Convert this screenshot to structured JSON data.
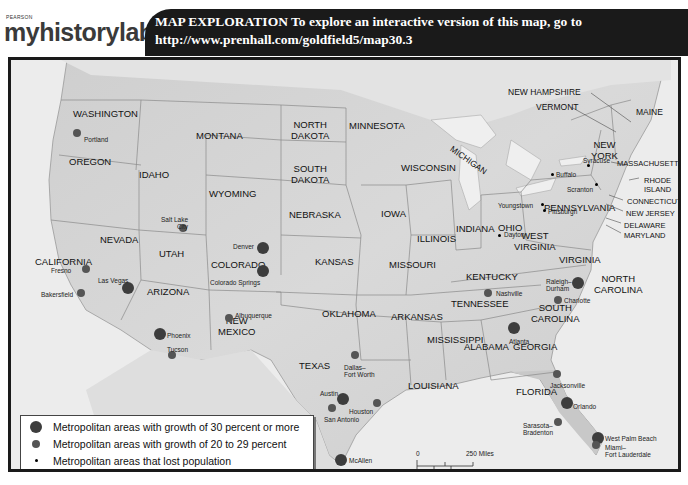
{
  "header": {
    "logo_small": "PEARSON",
    "logo_brand": "myhistorylab",
    "banner_line1": "MAP EXPLORATION  To explore an interactive version of this map, go to",
    "banner_line2": "http://www.prenhall.com/goldfield5/map30.3"
  },
  "map": {
    "states": [
      {
        "name": "WASHINGTON",
        "x": 62,
        "y": 48
      },
      {
        "name": "OREGON",
        "x": 58,
        "y": 96
      },
      {
        "name": "IDAHO",
        "x": 128,
        "y": 109
      },
      {
        "name": "MONTANA",
        "x": 185,
        "y": 70
      },
      {
        "name": "WYOMING",
        "x": 198,
        "y": 128
      },
      {
        "name": "NEVADA",
        "x": 89,
        "y": 174
      },
      {
        "name": "UTAH",
        "x": 148,
        "y": 188
      },
      {
        "name": "COLORADO",
        "x": 200,
        "y": 199
      },
      {
        "name": "CALIFORNIA",
        "x": 24,
        "y": 196
      },
      {
        "name": "ARIZONA",
        "x": 136,
        "y": 226
      },
      {
        "name": "NEW\nMEXICO",
        "x": 207,
        "y": 255
      },
      {
        "name": "NORTH\nDAKOTA",
        "x": 280,
        "y": 59
      },
      {
        "name": "SOUTH\nDAKOTA",
        "x": 280,
        "y": 103
      },
      {
        "name": "NEBRASKA",
        "x": 278,
        "y": 149
      },
      {
        "name": "KANSAS",
        "x": 304,
        "y": 196
      },
      {
        "name": "OKLAHOMA",
        "x": 311,
        "y": 248
      },
      {
        "name": "TEXAS",
        "x": 288,
        "y": 300
      },
      {
        "name": "MINNESOTA",
        "x": 338,
        "y": 60
      },
      {
        "name": "IOWA",
        "x": 370,
        "y": 148
      },
      {
        "name": "MISSOURI",
        "x": 378,
        "y": 199
      },
      {
        "name": "ARKANSAS",
        "x": 380,
        "y": 251
      },
      {
        "name": "LOUISIANA",
        "x": 397,
        "y": 320
      },
      {
        "name": "MISSISSIPPI",
        "x": 416,
        "y": 274
      },
      {
        "name": "WISCONSIN",
        "x": 390,
        "y": 102
      },
      {
        "name": "ILLINOIS",
        "x": 406,
        "y": 173
      },
      {
        "name": "MICHIGAN",
        "x": 436,
        "y": 95
      },
      {
        "name": "INDIANA",
        "x": 445,
        "y": 163
      },
      {
        "name": "OHIO",
        "x": 487,
        "y": 162
      },
      {
        "name": "KENTUCKY",
        "x": 455,
        "y": 211
      },
      {
        "name": "TENNESSEE",
        "x": 440,
        "y": 238
      },
      {
        "name": "ALABAMA",
        "x": 453,
        "y": 281
      },
      {
        "name": "GEORGIA",
        "x": 502,
        "y": 281
      },
      {
        "name": "FLORIDA",
        "x": 505,
        "y": 326
      },
      {
        "name": "SOUTH\nCAROLINA",
        "x": 520,
        "y": 242
      },
      {
        "name": "NORTH\nCAROLINA",
        "x": 583,
        "y": 213
      },
      {
        "name": "VIRGINIA",
        "x": 548,
        "y": 194
      },
      {
        "name": "WEST\nVIRGINIA",
        "x": 503,
        "y": 170
      },
      {
        "name": "PENNSYLVANIA",
        "x": 533,
        "y": 142
      },
      {
        "name": "NEW\nYORK",
        "x": 580,
        "y": 79
      },
      {
        "name": "NEW HAMPSHIRE",
        "x": 497,
        "y": 27
      },
      {
        "name": "VERMONT",
        "x": 525,
        "y": 42
      },
      {
        "name": "MAINE",
        "x": 625,
        "y": 47
      },
      {
        "name": "MASSACHUSETTS",
        "x": 606,
        "y": 98
      },
      {
        "name": "RHODE\nISLAND",
        "x": 633,
        "y": 116
      },
      {
        "name": "CONNECTICUT",
        "x": 616,
        "y": 136
      },
      {
        "name": "NEW JERSEY",
        "x": 615,
        "y": 148
      },
      {
        "name": "DELAWARE",
        "x": 613,
        "y": 160
      },
      {
        "name": "MARYLAND",
        "x": 613,
        "y": 170
      }
    ],
    "cities": [
      {
        "name": "Portland",
        "size": "med",
        "x": 66,
        "y": 73,
        "lx": 73,
        "ly": 76
      },
      {
        "name": "Salt Lake\nCity",
        "size": "med",
        "x": 172,
        "y": 168,
        "lx": 150,
        "ly": 156
      },
      {
        "name": "Denver",
        "size": "big",
        "x": 252,
        "y": 188,
        "lx": 222,
        "ly": 183
      },
      {
        "name": "Colorado Springs",
        "size": "big",
        "x": 252,
        "y": 211,
        "lx": 199,
        "ly": 219
      },
      {
        "name": "Fresno",
        "size": "med",
        "x": 75,
        "y": 209,
        "lx": 40,
        "ly": 207
      },
      {
        "name": "Bakersfield",
        "size": "med",
        "x": 70,
        "y": 233,
        "lx": 30,
        "ly": 231
      },
      {
        "name": "Las Vegas",
        "size": "big",
        "x": 117,
        "y": 228,
        "lx": 87,
        "ly": 217
      },
      {
        "name": "Phoenix",
        "size": "big",
        "x": 149,
        "y": 274,
        "lx": 156,
        "ly": 272
      },
      {
        "name": "Tucson",
        "size": "med",
        "x": 161,
        "y": 295,
        "lx": 156,
        "ly": 286
      },
      {
        "name": "Albuquerque",
        "size": "med",
        "x": 218,
        "y": 258,
        "lx": 224,
        "ly": 252
      },
      {
        "name": "Dallas–\nFort Worth",
        "size": "med",
        "x": 344,
        "y": 295,
        "lx": 333,
        "ly": 304
      },
      {
        "name": "Austin",
        "size": "big",
        "x": 332,
        "y": 339,
        "lx": 309,
        "ly": 330
      },
      {
        "name": "San Antonio",
        "size": "med",
        "x": 321,
        "y": 348,
        "lx": 313,
        "ly": 356
      },
      {
        "name": "Houston",
        "size": "med",
        "x": 366,
        "y": 343,
        "lx": 338,
        "ly": 348
      },
      {
        "name": "McAllen",
        "size": "big",
        "x": 330,
        "y": 400,
        "lx": 338,
        "ly": 397
      },
      {
        "name": "Nashville",
        "size": "med",
        "x": 477,
        "y": 233,
        "lx": 485,
        "ly": 230
      },
      {
        "name": "Raleigh–\nDurham",
        "size": "big",
        "x": 567,
        "y": 223,
        "lx": 535,
        "ly": 218
      },
      {
        "name": "Charlotte",
        "size": "med",
        "x": 547,
        "y": 240,
        "lx": 553,
        "ly": 237
      },
      {
        "name": "Atlanta",
        "size": "big",
        "x": 503,
        "y": 268,
        "lx": 498,
        "ly": 278
      },
      {
        "name": "Jacksonville",
        "size": "med",
        "x": 546,
        "y": 314,
        "lx": 539,
        "ly": 322
      },
      {
        "name": "Orlando",
        "size": "big",
        "x": 556,
        "y": 343,
        "lx": 562,
        "ly": 343
      },
      {
        "name": "Sarasota–\nBradenton",
        "size": "med",
        "x": 547,
        "y": 362,
        "lx": 512,
        "ly": 362
      },
      {
        "name": "West Palm Beach",
        "size": "big",
        "x": 587,
        "y": 378,
        "lx": 594,
        "ly": 375
      },
      {
        "name": "Miami–\nFort Lauderdale",
        "size": "med",
        "x": 585,
        "y": 385,
        "lx": 594,
        "ly": 384
      },
      {
        "name": "Buffalo",
        "size": "small",
        "x": 541,
        "y": 114,
        "lx": 545,
        "ly": 111
      },
      {
        "name": "Syracuse",
        "size": "small",
        "x": 577,
        "y": 105,
        "lx": 572,
        "ly": 97
      },
      {
        "name": "Scranton",
        "size": "small",
        "x": 585,
        "y": 124,
        "lx": 556,
        "ly": 126
      },
      {
        "name": "Youngstown",
        "size": "small",
        "x": 531,
        "y": 144,
        "lx": 487,
        "ly": 142
      },
      {
        "name": "Pittsburgh",
        "size": "small",
        "x": 533,
        "y": 150,
        "lx": 537,
        "ly": 148
      },
      {
        "name": "Dayton",
        "size": "small",
        "x": 488,
        "y": 175,
        "lx": 493,
        "ly": 171
      }
    ]
  },
  "legend": {
    "items": [
      {
        "size": "big",
        "label": "Metropolitan areas with growth of 30 percent or more"
      },
      {
        "size": "med",
        "label": "Metropolitan areas with growth of 20 to 29 percent"
      },
      {
        "size": "small",
        "label": "Metropolitan areas that lost population"
      }
    ]
  },
  "scale": {
    "zero_top": "0",
    "miles": "250 Miles",
    "zero_bottom": "0",
    "kilometers": "250 Kilometers"
  }
}
